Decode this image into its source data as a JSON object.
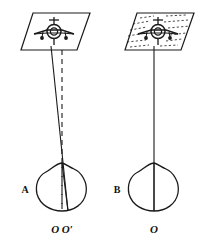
{
  "figure": {
    "type": "line-diagram",
    "background_color": "#ffffff",
    "stroke_color": "#1a1a1a",
    "panels": [
      {
        "id": "panel-a",
        "label": "A",
        "aircraft_icon": "airplane-top-view-icon",
        "surface_icon": "parallelogram-plane-icon",
        "surface_hatched": false,
        "sight_lines": [
          {
            "name": "true-line-of-sight",
            "style": "solid",
            "x1": 51,
            "y1": 47,
            "x2": 68,
            "y2": 210
          },
          {
            "name": "apparent-line-of-sight",
            "style": "dashed",
            "x1": 62,
            "y1": 51,
            "x2": 62,
            "y2": 208
          }
        ],
        "eye": {
          "name": "eye-outline",
          "cx": 62,
          "cy": 186,
          "label_left": "A"
        },
        "point_labels": [
          "O",
          "O′"
        ],
        "point_label_combined": "O O′"
      },
      {
        "id": "panel-b",
        "label": "B",
        "aircraft_icon": "airplane-top-view-icon",
        "surface_icon": "parallelogram-plane-icon",
        "surface_hatched": true,
        "sight_lines": [
          {
            "name": "line-of-sight",
            "style": "solid",
            "x1": 154,
            "y1": 47,
            "x2": 154,
            "y2": 210
          }
        ],
        "eye": {
          "name": "eye-outline",
          "cx": 154,
          "cy": 186,
          "label_left": "B"
        },
        "point_labels": [
          "O"
        ],
        "point_label_combined": "O"
      }
    ]
  }
}
